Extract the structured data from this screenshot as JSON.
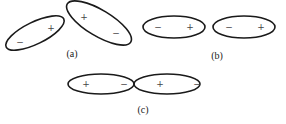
{
  "figure": {
    "panels": [
      {
        "id": "a",
        "label": "(a)",
        "description": "Two tilted orbital lobes (non-collinear overlap)",
        "lobes": [
          {
            "cx": 35,
            "cy": 33,
            "rx": 32,
            "ry": 11,
            "angle": -26,
            "signs": [
              {
                "text": "+",
                "x": 51,
                "y": 28
              },
              {
                "text": "−",
                "x": 20,
                "y": 42
              }
            ]
          },
          {
            "cx": 99,
            "cy": 23,
            "rx": 37,
            "ry": 13,
            "angle": 31,
            "signs": [
              {
                "text": "+",
                "x": 84,
                "y": 17
              },
              {
                "text": "−",
                "x": 116,
                "y": 33
              }
            ]
          }
        ],
        "label_pos": {
          "x": 72,
          "y": 53
        }
      },
      {
        "id": "b",
        "label": "(b)",
        "description": "Two parallel lobes side by side",
        "lobes": [
          {
            "cx": 174,
            "cy": 27,
            "rx": 31,
            "ry": 11,
            "angle": 0,
            "signs": [
              {
                "text": "−",
                "x": 158,
                "y": 27
              },
              {
                "text": "+",
                "x": 190,
                "y": 27
              }
            ]
          },
          {
            "cx": 244,
            "cy": 27,
            "rx": 31,
            "ry": 11,
            "angle": 0,
            "signs": [
              {
                "text": "−",
                "x": 229,
                "y": 27
              },
              {
                "text": "+",
                "x": 261,
                "y": 27
              }
            ]
          }
        ],
        "label_pos": {
          "x": 217,
          "y": 55
        }
      },
      {
        "id": "c",
        "label": "(c)",
        "description": "Two collinear lobes touching end to end",
        "lobes": [
          {
            "cx": 101,
            "cy": 84,
            "rx": 33,
            "ry": 10,
            "angle": 0,
            "signs": [
              {
                "text": "+",
                "x": 86,
                "y": 84
              },
              {
                "text": "−",
                "x": 124,
                "y": 84
              }
            ]
          },
          {
            "cx": 167,
            "cy": 84,
            "rx": 33,
            "ry": 10,
            "angle": 0,
            "signs": [
              {
                "text": "+",
                "x": 160,
                "y": 84
              },
              {
                "text": "−",
                "x": 197,
                "y": 84
              }
            ]
          }
        ],
        "label_pos": {
          "x": 143,
          "y": 109
        }
      }
    ],
    "colors": {
      "stroke": "#1a1a1a",
      "sign": "#444444",
      "label": "#222222",
      "background": "#ffffff"
    }
  }
}
